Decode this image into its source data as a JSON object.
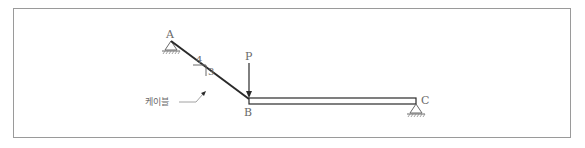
{
  "diagram": {
    "type": "structural-mechanics",
    "labels": {
      "point_a": "A",
      "point_b": "B",
      "point_c": "C",
      "load": "P",
      "slope_horizontal": "4",
      "slope_vertical": "3",
      "cable": "케이블"
    },
    "elements": {
      "cable": {
        "from": "A",
        "to": "B",
        "slope": "3:4"
      },
      "beam": {
        "from": "B",
        "to": "C"
      },
      "support_a": "pin",
      "support_c": "pin",
      "load_p": {
        "at": "B",
        "direction": "down"
      }
    },
    "colors": {
      "line": "#2a2a2a",
      "label": "#6a6a6a",
      "frame": "#9a9a9a"
    }
  }
}
